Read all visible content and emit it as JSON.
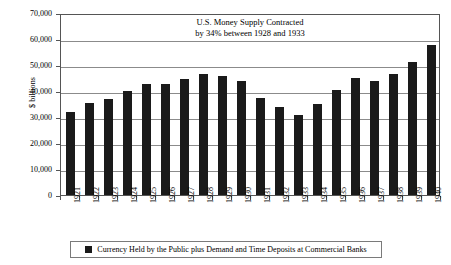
{
  "chart_data": {
    "type": "bar",
    "title": "U.S. Money Supply Contracted by 34% between 1928 and 1933",
    "title_lines": [
      "U.S. Money Supply Contracted",
      "by 34% between 1928 and 1933"
    ],
    "xlabel": "",
    "ylabel": "$ billions",
    "ylim": [
      0,
      70000
    ],
    "ytick_labels": [
      "70,000",
      "60,000",
      "50,000",
      "40,000",
      "30,000",
      "20,000",
      "10,000",
      "0"
    ],
    "ytick_values": [
      70000,
      60000,
      50000,
      40000,
      30000,
      20000,
      10000,
      0
    ],
    "grid": true,
    "legend_position": "bottom",
    "bar_color": "#1a1a1a",
    "categories": [
      "1921",
      "1922",
      "1923",
      "1924",
      "1925",
      "1926",
      "1927",
      "1928",
      "1929",
      "1930",
      "1931",
      "1932",
      "1933",
      "1934",
      "1935",
      "1936",
      "1937",
      "1938",
      "1939",
      "1940"
    ],
    "series": [
      {
        "name": "Currency Held by the Public plus Demand and Time Deposits at Commercial Banks",
        "values": [
          31900,
          35400,
          36900,
          40000,
          42800,
          42800,
          44800,
          46600,
          45800,
          44000,
          37300,
          34000,
          30800,
          35000,
          40400,
          44900,
          44000,
          46500,
          51200,
          57600
        ]
      }
    ],
    "annotations": []
  },
  "legend": {
    "swatch_name": "legend-swatch-dark",
    "label": "Currency Held by the Public plus Demand and Time Deposits at Commercial Banks"
  }
}
